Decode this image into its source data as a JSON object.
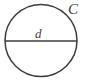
{
  "figure": {
    "type": "geometry-diagram",
    "background_color": "#ffffff",
    "stroke_color": "#3c3c3c",
    "label_color": "#3c3c3c",
    "circle": {
      "name": "circle-outline",
      "center_x": 41,
      "center_y": 40.5,
      "radius": 36,
      "stroke_width": 1.5,
      "fill": "none"
    },
    "diameter": {
      "name": "diameter-line",
      "x1": 5,
      "y1": 41,
      "x2": 77,
      "y2": 41,
      "stroke_width": 1.6
    },
    "labels": [
      {
        "id": "d",
        "text": "d",
        "meaning": "diameter",
        "x": 35,
        "y": 27,
        "font_size": 13,
        "style": "italic"
      },
      {
        "id": "C",
        "text": "C",
        "meaning": "circumference",
        "x": 68,
        "y": 2,
        "font_size": 15,
        "style": "italic"
      }
    ]
  }
}
